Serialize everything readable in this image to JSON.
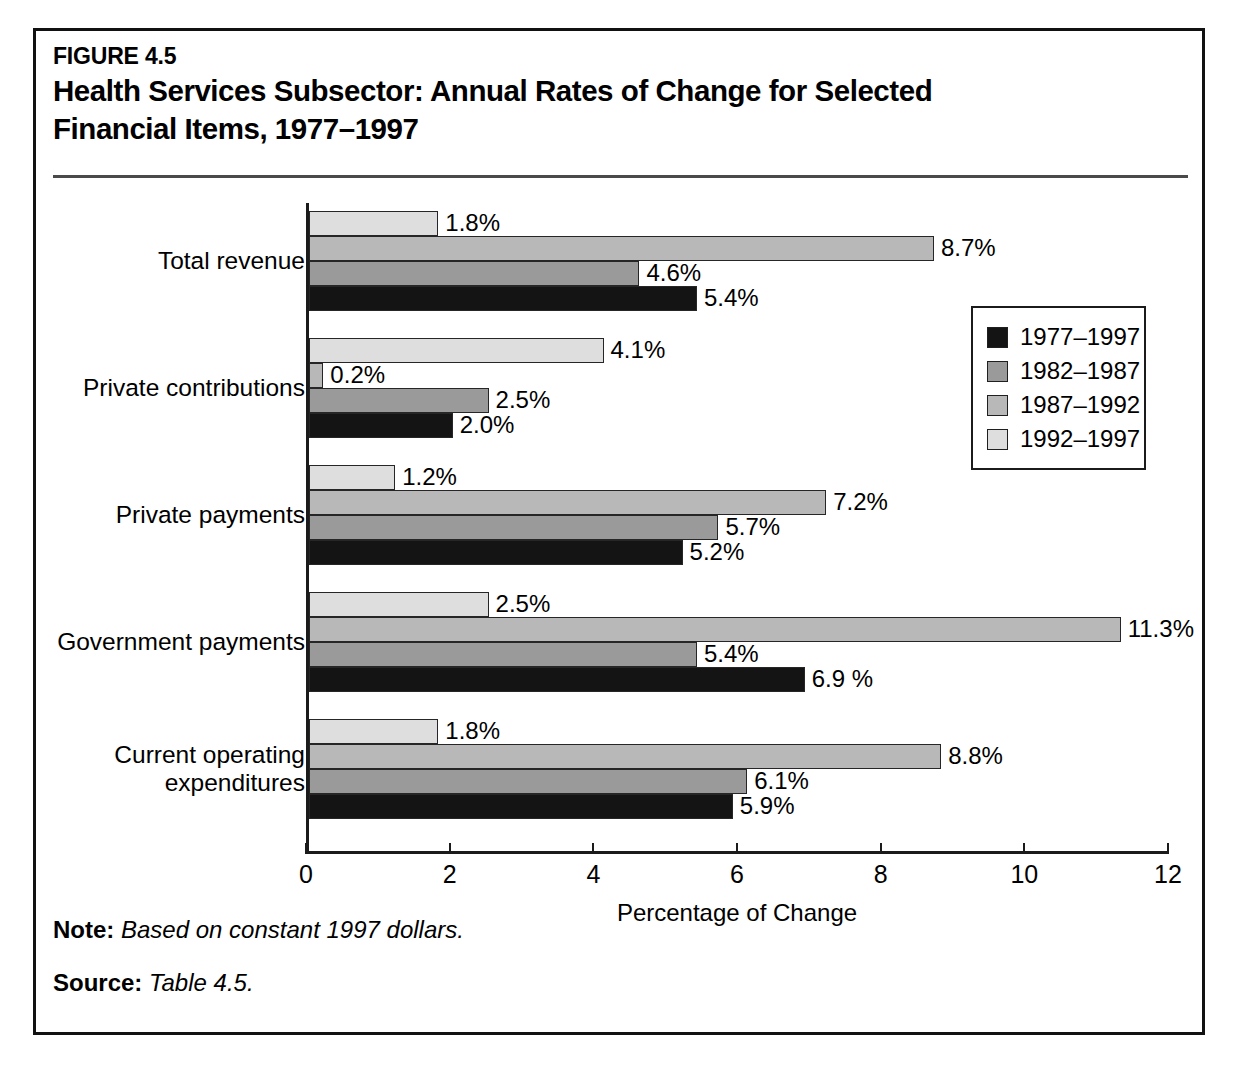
{
  "figure": {
    "number": "FIGURE 4.5",
    "title": "Health Services Subsector: Annual Rates of Change for Selected Financial Items, 1977–1997"
  },
  "notes": {
    "note_key": "Note:",
    "note_text": "Based on constant 1997 dollars.",
    "source_key": "Source:",
    "source_text": "Table 4.5."
  },
  "legend": {
    "items": [
      {
        "label": "1977–1997",
        "color": "#141414"
      },
      {
        "label": "1982–1987",
        "color": "#9a9a9a"
      },
      {
        "label": "1987–1992",
        "color": "#b8b8b8"
      },
      {
        "label": "1992–1997",
        "color": "#dedede"
      }
    ]
  },
  "axis": {
    "x_title": "Percentage of Change",
    "x_ticks": [
      "0",
      "2",
      "4",
      "6",
      "8",
      "10",
      "12"
    ]
  },
  "chart_data": {
    "type": "bar",
    "orientation": "horizontal",
    "title": "Health Services Subsector: Annual Rates of Change for Selected Financial Items, 1977–1997",
    "xlabel": "Percentage of Change",
    "ylabel": "",
    "xlim": [
      0,
      12
    ],
    "xticks": [
      0,
      2,
      4,
      6,
      8,
      10,
      12
    ],
    "grid": false,
    "legend_position": "right-inside",
    "categories": [
      "Total revenue",
      "Private contributions",
      "Private payments",
      "Government payments",
      "Current operating expenditures"
    ],
    "series": [
      {
        "name": "1977–1997",
        "color": "#141414",
        "values": [
          5.4,
          2.0,
          5.2,
          6.9,
          5.9
        ],
        "labels": [
          "5.4%",
          "2.0%",
          "5.2%",
          "6.9 %",
          "5.9%"
        ]
      },
      {
        "name": "1982–1987",
        "color": "#9a9a9a",
        "values": [
          4.6,
          2.5,
          5.7,
          5.4,
          6.1
        ],
        "labels": [
          "4.6%",
          "2.5%",
          "5.7%",
          "5.4%",
          "6.1%"
        ]
      },
      {
        "name": "1987–1992",
        "color": "#b8b8b8",
        "values": [
          8.7,
          0.2,
          7.2,
          11.3,
          8.8
        ],
        "labels": [
          "8.7%",
          "0.2%",
          "7.2%",
          "11.3%",
          "8.8%"
        ]
      },
      {
        "name": "1992–1997",
        "color": "#dedede",
        "values": [
          1.8,
          4.1,
          1.2,
          2.5,
          1.8
        ],
        "labels": [
          "1.8%",
          "4.1%",
          "1.2%",
          "2.5%",
          "1.8%"
        ]
      }
    ]
  },
  "category_display": [
    "Total revenue",
    "Private contributions",
    "Private payments",
    "Government payments",
    "Current operating\nexpenditures"
  ]
}
